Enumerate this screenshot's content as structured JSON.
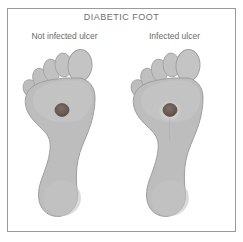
{
  "figure": {
    "title": "DIABETIC FOOT",
    "border_color": "#9a9a9a",
    "background_color": "#ffffff",
    "title_color": "#6e6e6e"
  },
  "panels": [
    {
      "id": "not-infected",
      "label": "Not infected ulcer",
      "foot_view": "plantar",
      "foot_fill": "#bdbdbd",
      "foot_outline": "#9e9e9e",
      "ulcer": {
        "fill": "#6b5f58",
        "has_halo": false,
        "cx": 44,
        "cy": 62,
        "r": 6.5
      }
    },
    {
      "id": "infected",
      "label": "Infected ulcer",
      "foot_view": "plantar",
      "foot_fill": "#bdbdbd",
      "foot_outline": "#9e9e9e",
      "ulcer": {
        "fill": "#6b5f58",
        "has_halo": true,
        "halo_fill": "#d2cdc9",
        "cx": 44,
        "cy": 62,
        "r": 6.5,
        "halo_r": 11
      }
    }
  ]
}
